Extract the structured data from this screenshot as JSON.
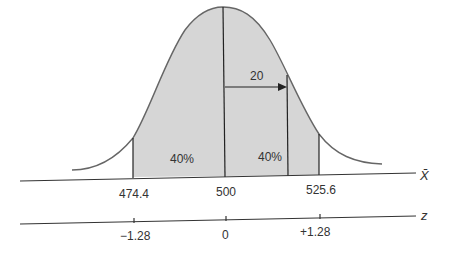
{
  "diagram": {
    "type": "normal-distribution",
    "colors": {
      "fill": "#d6d6d6",
      "curve": "#666666",
      "line": "#222222",
      "text": "#333333"
    },
    "arrow_label": "20",
    "region_labels": [
      "40%",
      "40%"
    ],
    "xbar_axis": {
      "name": "X̄",
      "ticks": [
        "474.4",
        "500",
        "525.6"
      ]
    },
    "z_axis": {
      "name": "z",
      "ticks": [
        "−1.28",
        "0",
        "+1.28"
      ]
    }
  }
}
